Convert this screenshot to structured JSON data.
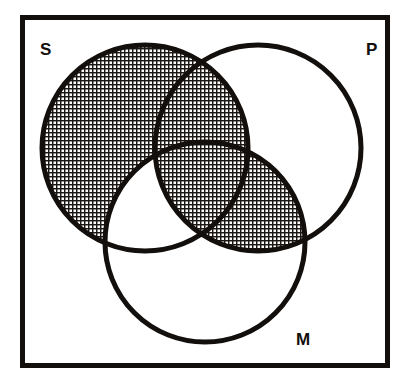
{
  "figure": {
    "kind": "venn-diagram",
    "background_color": "#ffffff",
    "ink_color": "#120f0d",
    "shading_style": "fine cross-hatch grid",
    "canvas": {
      "width": 411,
      "height": 388
    }
  },
  "frame": {
    "name": "universe-box",
    "x": 20,
    "y": 15,
    "width": 370,
    "height": 353,
    "stroke_width": 5,
    "color": "#120f0d"
  },
  "labels": [
    {
      "id": "S",
      "text": "S",
      "x": 40,
      "y": 55,
      "corner": "top-left"
    },
    {
      "id": "P",
      "text": "P",
      "x": 366,
      "y": 55,
      "corner": "top-right"
    },
    {
      "id": "M",
      "text": "M",
      "x": 296,
      "y": 345,
      "corner": "bottom-right"
    }
  ],
  "circles": [
    {
      "id": "S",
      "label": "S",
      "cx": 145,
      "cy": 148,
      "r": 103,
      "stroke_width": 5
    },
    {
      "id": "P",
      "label": "P",
      "cx": 258,
      "cy": 148,
      "r": 103,
      "stroke_width": 5
    },
    {
      "id": "M",
      "label": "M",
      "cx": 205,
      "cy": 242,
      "r": 100,
      "stroke_width": 5
    }
  ],
  "regions": [
    {
      "id": "S-only",
      "expression": "S only",
      "shaded": true
    },
    {
      "id": "P-only",
      "expression": "P only",
      "shaded": false
    },
    {
      "id": "M-only",
      "expression": "M only",
      "shaded": false
    },
    {
      "id": "S-and-P",
      "expression": "S and P",
      "shaded": true
    },
    {
      "id": "S-and-M",
      "expression": "S and M",
      "shaded": false
    },
    {
      "id": "P-and-M",
      "expression": "P and M",
      "shaded": true
    },
    {
      "id": "S-P-M",
      "expression": "S and P and M",
      "shaded": true
    },
    {
      "id": "outside",
      "expression": "outside all circles",
      "shaded": false
    }
  ],
  "shaded_summary": "Shaded: S minus M, S intersect P, S intersect P intersect M, and P intersect M."
}
